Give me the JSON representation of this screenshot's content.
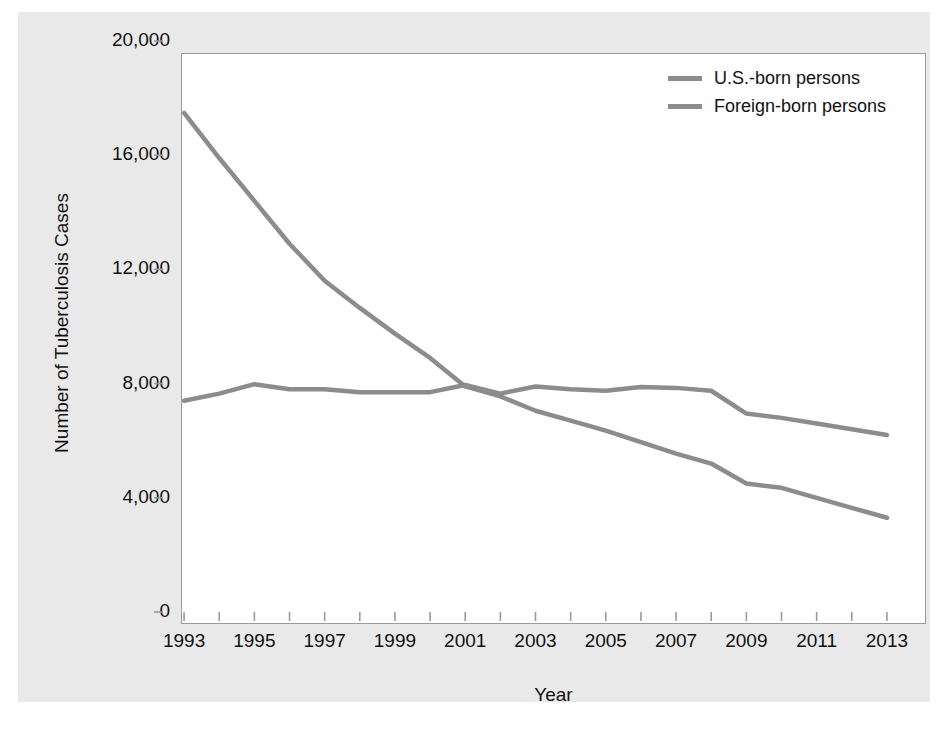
{
  "chart_data": {
    "type": "line",
    "title": "",
    "xlabel": "Year",
    "ylabel": "Number of Tuberculosis Cases",
    "xlim": [
      1992.4,
      2013.6
    ],
    "ylim": [
      0,
      20000
    ],
    "grid": false,
    "legend_position": "top-right",
    "x": [
      1993,
      1994,
      1995,
      1996,
      1997,
      1998,
      1999,
      2000,
      2001,
      2002,
      2003,
      2004,
      2005,
      2006,
      2007,
      2008,
      2009,
      2010,
      2011,
      2012,
      2013
    ],
    "xtick_labels": [
      "1993",
      "1995",
      "1997",
      "1999",
      "2001",
      "2003",
      "2005",
      "2007",
      "2009",
      "2011",
      "2013"
    ],
    "xtick_values": [
      1993,
      1995,
      1997,
      1999,
      2001,
      2003,
      2005,
      2007,
      2009,
      2011,
      2013
    ],
    "ytick_labels": [
      "0",
      "4,000",
      "8,000",
      "12,000",
      "16,000",
      "20,000"
    ],
    "ytick_values": [
      0,
      4000,
      8000,
      12000,
      16000,
      20000
    ],
    "series": [
      {
        "name": "U.S.-born persons",
        "color": "#8c8c8c",
        "values": [
          17480,
          15900,
          14400,
          12900,
          11600,
          10650,
          9750,
          8900,
          7900,
          7550,
          7050,
          6700,
          6350,
          5950,
          5550,
          5200,
          4500,
          4350,
          4000,
          3650,
          3300
        ]
      },
      {
        "name": "Foreign-born persons",
        "color": "#8c8c8c",
        "values": [
          7400,
          7650,
          7980,
          7800,
          7800,
          7700,
          7700,
          7700,
          7950,
          7650,
          7900,
          7800,
          7750,
          7880,
          7850,
          7750,
          6950,
          6800,
          6600,
          6400,
          6200
        ]
      }
    ]
  },
  "legend": {
    "items": [
      {
        "label": "U.S.-born persons",
        "color": "#8c8c8c"
      },
      {
        "label": "Foreign-born persons",
        "color": "#8c8c8c"
      }
    ]
  },
  "axes": {
    "x_title": "Year",
    "y_title": "Number of Tuberculosis Cases"
  },
  "colors": {
    "panel_background": "#e9e9e9",
    "plot_background": "#ffffff",
    "axis": "#9a9a9a",
    "text": "#111111",
    "series_line": "#8c8c8c"
  }
}
